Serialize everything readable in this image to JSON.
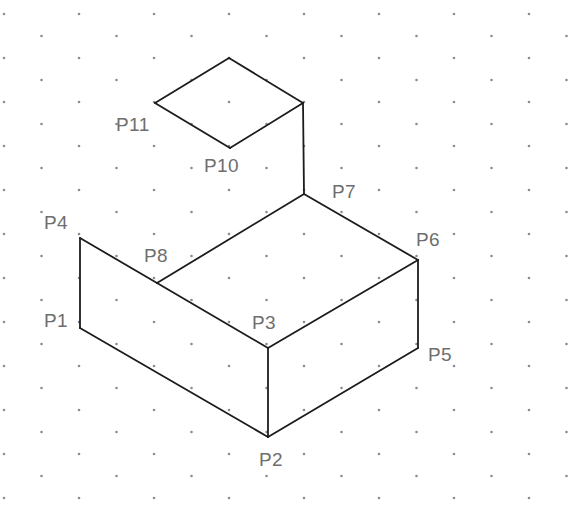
{
  "figure": {
    "type": "isometric-line-drawing",
    "canvas": {
      "width": 568,
      "height": 518,
      "background": "#ffffff"
    },
    "style": {
      "stroke_color": "#1c1c1c",
      "stroke_width": 1.8,
      "label_color": "#6e6e6e",
      "label_font_size": 19,
      "dot_color": "#8a8a99",
      "dot_radius": 1.3
    },
    "grid": {
      "kind": "staggered-dot-grid",
      "spacing_x": 75,
      "spacing_y": 22,
      "row_offset_x": 37.5,
      "origin_x": 4,
      "origin_y": 14
    },
    "points": [
      {
        "id": "P1",
        "label": "P1",
        "x": 80,
        "y": 328,
        "label_x": 44,
        "label_y": 311
      },
      {
        "id": "P2",
        "label": "P2",
        "x": 268,
        "y": 437,
        "label_x": 259,
        "label_y": 450
      },
      {
        "id": "P3",
        "label": "P3",
        "x": 268,
        "y": 348,
        "label_x": 252,
        "label_y": 313
      },
      {
        "id": "P4",
        "label": "P4",
        "x": 80,
        "y": 238,
        "label_x": 44,
        "label_y": 213
      },
      {
        "id": "P5",
        "label": "P5",
        "x": 418,
        "y": 348,
        "label_x": 428,
        "label_y": 345
      },
      {
        "id": "P6",
        "label": "P6",
        "x": 418,
        "y": 260,
        "label_x": 416,
        "label_y": 230
      },
      {
        "id": "P7",
        "label": "P7",
        "x": 304,
        "y": 194,
        "label_x": 332,
        "label_y": 182
      },
      {
        "id": "P8",
        "label": "P8",
        "x": 157,
        "y": 283,
        "label_x": 144,
        "label_y": 246
      },
      {
        "id": "P10",
        "label": "P10",
        "x": 230,
        "y": 148,
        "label_x": 204,
        "label_y": 156
      },
      {
        "id": "P11",
        "label": "P11",
        "x": 155,
        "y": 103,
        "label_x": 116,
        "label_y": 115
      },
      {
        "id": "PA",
        "label": "",
        "x": 229,
        "y": 58,
        "label_x": 0,
        "label_y": 0
      },
      {
        "id": "PB",
        "label": "",
        "x": 303,
        "y": 103,
        "label_x": 0,
        "label_y": 0
      }
    ],
    "edges": [
      {
        "name": "edge-p11-apex",
        "from": "P11",
        "to": "PA"
      },
      {
        "name": "edge-apex-pb",
        "from": "PA",
        "to": "PB"
      },
      {
        "name": "edge-pb-p10",
        "from": "PB",
        "to": "P10"
      },
      {
        "name": "edge-p10-p11",
        "from": "P10",
        "to": "P11"
      },
      {
        "name": "edge-pb-p7",
        "from": "PB",
        "to": "P7"
      },
      {
        "name": "edge-p7-p8",
        "from": "P7",
        "to": "P8"
      },
      {
        "name": "edge-p7-p6",
        "from": "P7",
        "to": "P6"
      },
      {
        "name": "edge-p8-p4",
        "from": "P8",
        "to": "P4"
      },
      {
        "name": "edge-p8-p3",
        "from": "P8",
        "to": "P3"
      },
      {
        "name": "edge-p4-p1",
        "from": "P4",
        "to": "P1"
      },
      {
        "name": "edge-p1-p2",
        "from": "P1",
        "to": "P2"
      },
      {
        "name": "edge-p3-p2",
        "from": "P3",
        "to": "P2"
      },
      {
        "name": "edge-p3-p6",
        "from": "P3",
        "to": "P6"
      },
      {
        "name": "edge-p6-p5",
        "from": "P6",
        "to": "P5"
      },
      {
        "name": "edge-p5-p2",
        "from": "P5",
        "to": "P2"
      }
    ]
  }
}
